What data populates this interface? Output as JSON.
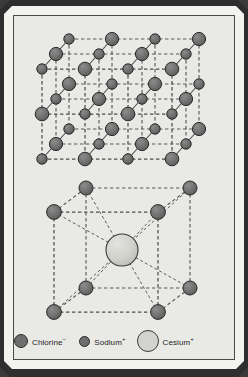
{
  "figure": {
    "kind": "crystal-lattice-diagram",
    "background_color": "#e9e9e6",
    "frame_color": "#f2f2ef",
    "outer_color": "#2e2e2e",
    "line_color": "#555555",
    "structures": [
      {
        "id": "nacl-lattice",
        "name": "Sodium chloride rock-salt lattice",
        "type": "face-centered-cubic-3x3x3",
        "center_label": ""
      },
      {
        "id": "cscl-lattice",
        "name": "Cesium chloride body-centered cubic cell",
        "type": "body-centered-cubic",
        "center_label": ""
      }
    ]
  },
  "legend": {
    "items": [
      {
        "id": "chlorine",
        "label": "Chlorine",
        "charge": "−",
        "color": "#6e6e6e",
        "outline": "#2b2b2b",
        "size": 14
      },
      {
        "id": "sodium",
        "label": "Sodium",
        "charge": "+",
        "color": "#6e6e6e",
        "outline": "#2b2b2b",
        "size": 11
      },
      {
        "id": "cesium",
        "label": "Cesium",
        "charge": "+",
        "color": "#d2d2ce",
        "outline": "#3a3a3a",
        "size": 22
      }
    ]
  },
  "palette": {
    "ion_large": "#6e6e6e",
    "ion_small": "#6e6e6e",
    "ion_cesium": "#d2d2ce",
    "ion_outline": "#2b2b2b",
    "bond_line": "#5a5a5a"
  }
}
